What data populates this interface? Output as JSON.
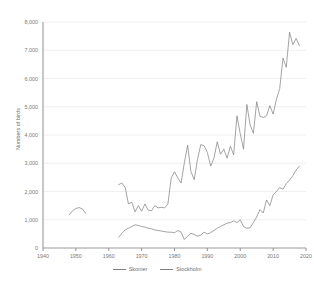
{
  "chart_data": {
    "type": "line",
    "title": "",
    "xlabel": "",
    "ylabel": "Numbers of birds",
    "xlim": [
      1940,
      2020
    ],
    "ylim": [
      0,
      8000
    ],
    "grid": true,
    "legend_position": "bottom",
    "xticks": [
      1940,
      1950,
      1960,
      1970,
      1980,
      1990,
      2000,
      2010,
      2020
    ],
    "xtick_labels": [
      "1940",
      "1950",
      "1960",
      "1970",
      "1980",
      "1990",
      "2000",
      "2010",
      "2020"
    ],
    "yticks": [
      0,
      1000,
      2000,
      3000,
      4000,
      5000,
      6000,
      7000,
      8000
    ],
    "ytick_labels": [
      "0",
      "1,000",
      "2,000",
      "3,000",
      "4,000",
      "5,000",
      "6,000",
      "7,000",
      "8,000"
    ],
    "series": [
      {
        "name": "Skomer",
        "color": "#808080",
        "segments": [
          {
            "x": [
              1948,
              1949,
              1950,
              1951,
              1952,
              1953
            ],
            "values": [
              1180,
              1320,
              1400,
              1430,
              1380,
              1220
            ]
          },
          {
            "x": [
              1963,
              1964,
              1965,
              1966,
              1967,
              1968,
              1969,
              1970,
              1971,
              1972,
              1973,
              1974,
              1975,
              1976,
              1977,
              1978,
              1979,
              1980,
              1981,
              1982,
              1983,
              1984,
              1985,
              1986,
              1987,
              1988,
              1989,
              1990,
              1991,
              1992,
              1993,
              1994,
              1995,
              1996,
              1997,
              1998,
              1999,
              2000,
              2001,
              2002,
              2003,
              2004,
              2005,
              2006,
              2007,
              2008,
              2009,
              2010,
              2011,
              2012,
              2013,
              2014,
              2015,
              2016,
              2017,
              2018
            ],
            "values": [
              2240,
              2300,
              2140,
              1560,
              1620,
              1280,
              1500,
              1300,
              1560,
              1340,
              1320,
              1500,
              1420,
              1440,
              1420,
              1560,
              2480,
              2700,
              2480,
              2300,
              3020,
              3640,
              2700,
              2420,
              3140,
              3660,
              3620,
              3380,
              2900,
              3180,
              3760,
              3320,
              3500,
              3180,
              3600,
              3300,
              4680,
              4040,
              3500,
              5080,
              4360,
              4060,
              5180,
              4660,
              4620,
              4680,
              5040,
              4740,
              5260,
              5640,
              6720,
              6400,
              7640,
              7200,
              7420,
              7160
            ]
          }
        ]
      },
      {
        "name": "Stockholm",
        "color": "#7f7f7f",
        "segments": [
          {
            "x": [
              1963,
              1964,
              1965,
              1966,
              1967,
              1968,
              1969,
              1970,
              1971,
              1972,
              1973,
              1974,
              1975,
              1976,
              1977,
              1978,
              1979,
              1980,
              1981,
              1982,
              1983,
              1984,
              1985,
              1986,
              1987,
              1988,
              1989,
              1990,
              1991,
              1992,
              1993,
              1994,
              1995,
              1996,
              1997,
              1998,
              1999,
              2000,
              2001,
              2002,
              2003,
              2004,
              2005,
              2006,
              2007,
              2008,
              2009,
              2010,
              2011,
              2012,
              2013,
              2014,
              2015,
              2016,
              2017,
              2018
            ],
            "values": [
              380,
              520,
              640,
              700,
              760,
              820,
              800,
              760,
              740,
              700,
              680,
              640,
              620,
              600,
              580,
              560,
              560,
              540,
              620,
              560,
              300,
              420,
              520,
              480,
              420,
              460,
              560,
              500,
              540,
              620,
              700,
              760,
              820,
              880,
              900,
              960,
              900,
              1000,
              760,
              700,
              720,
              900,
              1100,
              1360,
              1240,
              1700,
              1500,
              1880,
              2000,
              2140,
              2080,
              2280,
              2400,
              2560,
              2760,
              2900
            ]
          }
        ]
      }
    ]
  }
}
